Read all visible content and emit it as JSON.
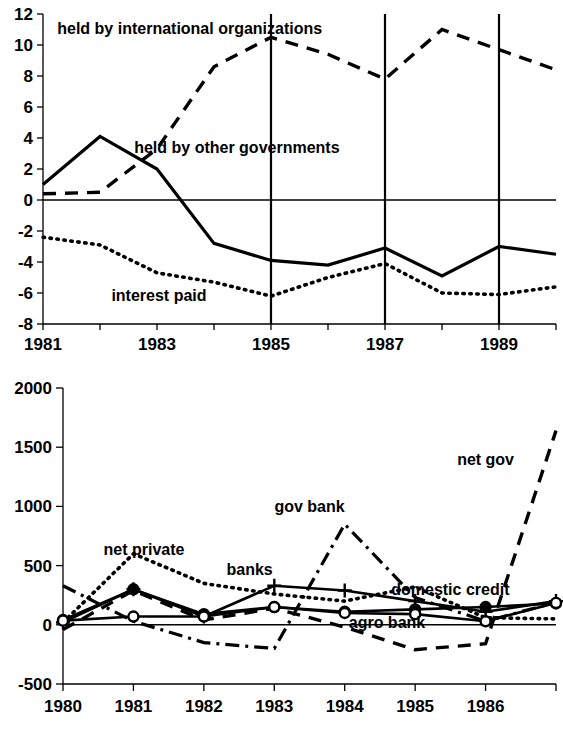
{
  "figure": {
    "title": "",
    "panels": [
      "external-debt-flows-panel",
      "domestic-credit-flows-panel"
    ]
  },
  "chart_data": [
    {
      "id": "top",
      "type": "line",
      "title": "",
      "xlabel": "",
      "ylabel": "",
      "xlim": [
        1981,
        1990
      ],
      "ylim": [
        -8,
        12
      ],
      "grid": "vertical gridlines at 1985, 1987, 1989",
      "legend": "inline annotations",
      "x": [
        1981,
        1982,
        1983,
        1984,
        1985,
        1986,
        1987,
        1988,
        1989,
        1990
      ],
      "xticks": [
        1981,
        1982,
        1983,
        1984,
        1985,
        1986,
        1987,
        1988,
        1989,
        1990
      ],
      "xtick_labels": [
        "1981",
        "",
        "1983",
        "",
        "1985",
        "",
        "1987",
        "",
        "1989",
        ""
      ],
      "yticks": [
        -8,
        -6,
        -4,
        -2,
        0,
        2,
        4,
        6,
        8,
        10,
        12
      ],
      "ytick_labels": [
        "-8",
        "-6",
        "-4",
        "-2",
        "0",
        "2",
        "4",
        "6",
        "8",
        "10",
        "12"
      ],
      "vlines": [
        1985,
        1987,
        1989
      ],
      "series": [
        {
          "name": "held by international organizations",
          "style": "dashed",
          "label_x": 1981.25,
          "label_y": 11.1,
          "values": [
            0.4,
            0.5,
            3.3,
            8.6,
            10.5,
            9.4,
            7.8,
            11.0,
            9.7,
            8.4
          ]
        },
        {
          "name": "held by other governments",
          "style": "solid",
          "label_x": 1982.6,
          "label_y": 3.4,
          "values": [
            1.0,
            4.1,
            2.0,
            -2.8,
            -3.9,
            -4.2,
            -3.1,
            -4.9,
            -3.0,
            -3.5
          ]
        },
        {
          "name": "interest paid",
          "style": "dotted",
          "label_x": 1982.2,
          "label_y": -6.1,
          "values": [
            -2.4,
            -2.9,
            -4.7,
            -5.3,
            -6.2,
            -5.0,
            -4.1,
            -6.0,
            -6.1,
            -5.6
          ]
        }
      ]
    },
    {
      "id": "bottom",
      "type": "line",
      "title": "",
      "xlabel": "",
      "ylabel": "",
      "xlim": [
        1980,
        1987
      ],
      "ylim": [
        -500,
        2000
      ],
      "grid": "none",
      "legend": "inline annotations",
      "x": [
        1980,
        1981,
        1982,
        1983,
        1984,
        1985,
        1986,
        1987
      ],
      "xticks": [
        1980,
        1981,
        1982,
        1983,
        1984,
        1985,
        1986,
        1987
      ],
      "xtick_labels": [
        "1980",
        "1981",
        "1982",
        "1983",
        "1984",
        "1985",
        "1986",
        ""
      ],
      "yticks": [
        -500,
        0,
        500,
        1000,
        1500,
        2000
      ],
      "ytick_labels": [
        "-500",
        "0",
        "500",
        "1000",
        "1500",
        "2000"
      ],
      "series": [
        {
          "name": "net private",
          "style": "dotted",
          "marker": "none",
          "label_x": 1981.15,
          "label_y": 640,
          "values": [
            20,
            600,
            350,
            260,
            200,
            320,
            60,
            50
          ]
        },
        {
          "name": "banks",
          "style": "solid",
          "marker": "plus",
          "label_x": 1982.65,
          "label_y": 470,
          "values": [
            20,
            300,
            70,
            330,
            290,
            200,
            110,
            200
          ]
        },
        {
          "name": "gov bank",
          "style": "dash-dot",
          "marker": "none",
          "label_x": 1983.5,
          "label_y": 1000,
          "values": [
            330,
            30,
            -150,
            -200,
            850,
            230,
            30,
            190
          ]
        },
        {
          "name": "net gov",
          "style": "dashed",
          "marker": "none",
          "label_x": 1986.0,
          "label_y": 1400,
          "values": [
            -40,
            290,
            40,
            140,
            -20,
            -210,
            -160,
            1640
          ]
        },
        {
          "name": "domestic credit",
          "style": "solid",
          "marker": "filled-circle",
          "label_x": 1985.5,
          "label_y": 300,
          "values": [
            40,
            300,
            90,
            150,
            110,
            130,
            150,
            180
          ]
        },
        {
          "name": "agro bank",
          "style": "solid",
          "marker": "open-circle",
          "label_x": 1984.6,
          "label_y": 25,
          "values": [
            35,
            70,
            70,
            150,
            100,
            90,
            30,
            185
          ]
        }
      ]
    }
  ],
  "style": {
    "line_color": "#000000",
    "background": "#ffffff",
    "axis_color": "#000000"
  }
}
